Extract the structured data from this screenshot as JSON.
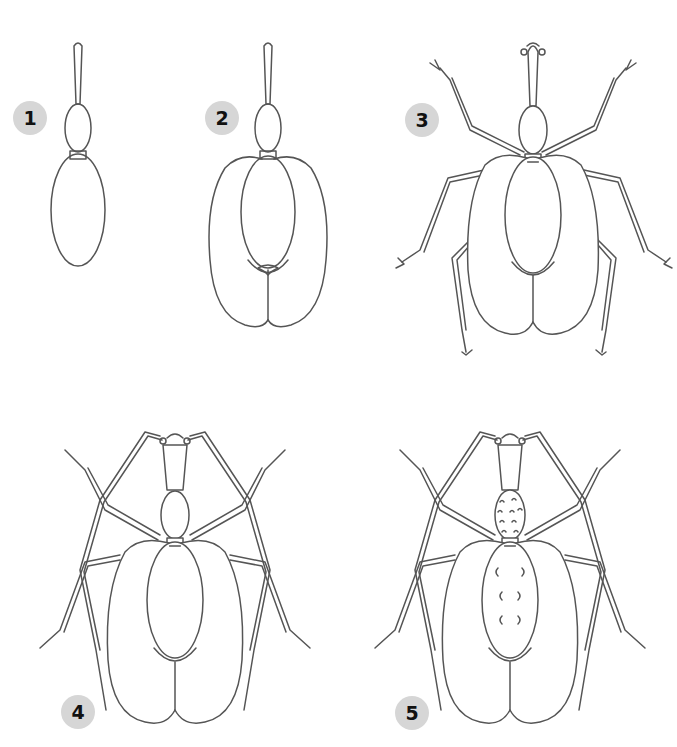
{
  "page": {
    "background": "#ffffff",
    "line_color": "#555555",
    "badge_color": "#d6d6d6"
  },
  "steps": [
    {
      "number": "1",
      "description": "Snout, head and body outline"
    },
    {
      "number": "2",
      "description": "Add wing covers (elytra)"
    },
    {
      "number": "3",
      "description": "Add legs and antenna tips"
    },
    {
      "number": "4",
      "description": "Add long front legs"
    },
    {
      "number": "5",
      "description": "Add texture and spots"
    }
  ]
}
